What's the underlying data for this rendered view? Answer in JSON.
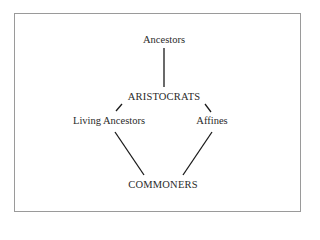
{
  "diagram": {
    "nodes": [
      {
        "id": "ancestors",
        "label": "Ancestors",
        "x": 164,
        "y": 40
      },
      {
        "id": "aristocrats",
        "label": "ARISTOCRATS",
        "x": 164,
        "y": 97
      },
      {
        "id": "living_ancestors",
        "label": "Living Ancestors",
        "x": 109,
        "y": 121
      },
      {
        "id": "affines",
        "label": "Affines",
        "x": 212,
        "y": 121
      },
      {
        "id": "commoners",
        "label": "COMMONERS",
        "x": 163,
        "y": 185
      }
    ],
    "edges": [
      {
        "from": "ancestors",
        "to": "aristocrats"
      },
      {
        "from": "aristocrats",
        "to": "living_ancestors"
      },
      {
        "from": "aristocrats",
        "to": "affines"
      },
      {
        "from": "living_ancestors",
        "to": "commoners"
      },
      {
        "from": "affines",
        "to": "commoners"
      }
    ],
    "colors": {
      "line": "#1a1a1a",
      "text": "#2a2a2a",
      "frame": "#9a9a9a"
    }
  }
}
